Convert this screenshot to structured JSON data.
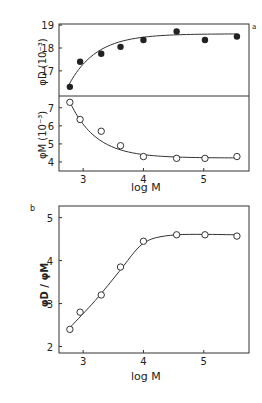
{
  "chart_data": [
    {
      "panel": "a",
      "type": "scatter",
      "subplots": [
        {
          "name": "phi_D",
          "ylabel": "φD (10⁻³)",
          "marker": "filled-circle",
          "yticks": [
            17,
            18,
            19
          ],
          "ylim": [
            15.9,
            19.05
          ],
          "x": [
            2.78,
            2.95,
            3.3,
            3.62,
            4.0,
            4.55,
            5.02,
            5.55
          ],
          "values": [
            16.3,
            17.4,
            17.75,
            18.05,
            18.35,
            18.72,
            18.35,
            18.5
          ],
          "fit_curve": true
        },
        {
          "name": "phi_M",
          "ylabel": "φM (10⁻³)",
          "marker": "open-circle",
          "yticks": [
            4,
            5,
            6,
            7
          ],
          "ylim": [
            3.5,
            7.65
          ],
          "x": [
            2.78,
            2.95,
            3.3,
            3.62,
            4.0,
            4.55,
            5.02,
            5.55
          ],
          "values": [
            7.3,
            6.35,
            5.7,
            4.9,
            4.3,
            4.2,
            4.2,
            4.3
          ],
          "fit_curve": true
        }
      ],
      "xlabel": "log M",
      "xticks": [
        3,
        4,
        5
      ],
      "xlim": [
        2.6,
        5.75
      ],
      "grid": false
    },
    {
      "panel": "b",
      "type": "line",
      "ylabel": "φD / φM",
      "marker": "open-circle",
      "x": [
        2.78,
        2.95,
        3.3,
        3.62,
        4.0,
        4.55,
        5.02,
        5.55
      ],
      "values": [
        2.4,
        2.8,
        3.2,
        3.85,
        4.45,
        4.6,
        4.6,
        4.57
      ],
      "xlabel": "log M",
      "xticks": [
        3,
        4,
        5
      ],
      "yticks": [
        2,
        3,
        4,
        5
      ],
      "xlim": [
        2.6,
        5.75
      ],
      "ylim": [
        1.85,
        5.27
      ],
      "grid": false
    }
  ],
  "labels": {
    "panel_a": "a",
    "panel_b": "b",
    "xlabel_a": "log M",
    "xlabel_b": "log M",
    "ylabel_phiD": "φD (10⁻³)",
    "ylabel_phiM": "φM (10⁻³)",
    "ylabel_ratio": "φD / φM"
  }
}
